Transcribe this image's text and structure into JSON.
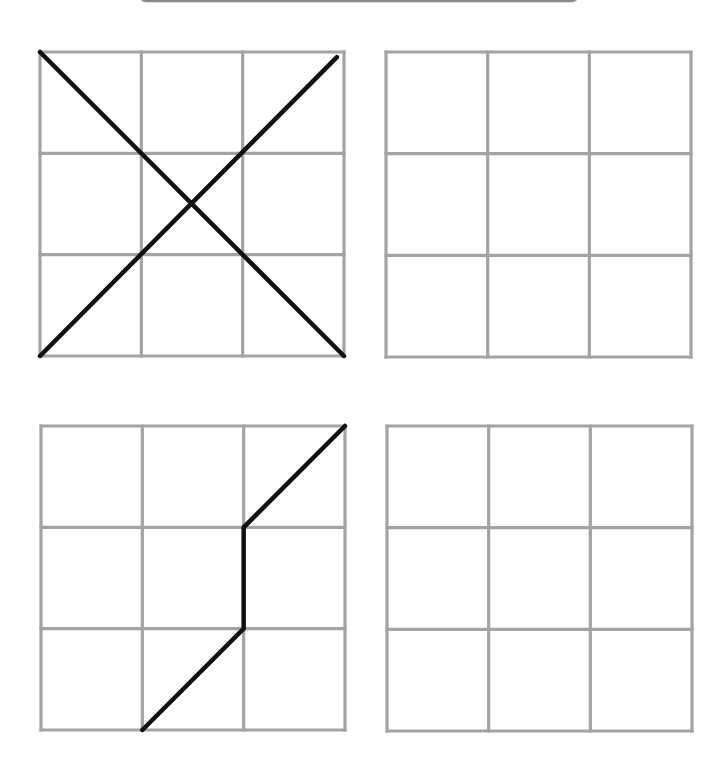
{
  "colors": {
    "grid_line": "#a3a3a3",
    "path_line": "#111111",
    "background": "#ffffff"
  },
  "layout": {
    "rows": 3,
    "cols": 3
  },
  "grids": [
    {
      "id": "top-left",
      "role": "example",
      "position": {
        "x": 40,
        "y": 52,
        "size": 304
      },
      "strokes": [
        {
          "points": [
            [
              0,
              0
            ],
            [
              3,
              3
            ]
          ]
        },
        {
          "points": [
            [
              0,
              3
            ],
            [
              2.93,
              0.05
            ]
          ]
        }
      ]
    },
    {
      "id": "top-right",
      "role": "blank-copy",
      "position": {
        "x": 386,
        "y": 52,
        "size": 305
      },
      "strokes": []
    },
    {
      "id": "bottom-left",
      "role": "example",
      "position": {
        "x": 41,
        "y": 426,
        "size": 304
      },
      "strokes": [
        {
          "points": [
            [
              1,
              3
            ],
            [
              2,
              2
            ],
            [
              2,
              1
            ],
            [
              3,
              0
            ]
          ]
        }
      ]
    },
    {
      "id": "bottom-right",
      "role": "blank-copy",
      "position": {
        "x": 387,
        "y": 426,
        "size": 305
      },
      "strokes": []
    }
  ]
}
